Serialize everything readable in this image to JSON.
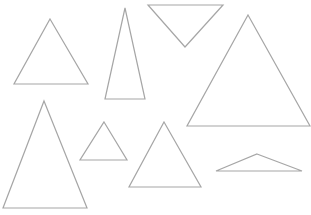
{
  "canvas": {
    "width": 311,
    "height": 215,
    "background": "#ffffff",
    "stroke_color": "#a6a6a6"
  },
  "shapes": [
    {
      "id": "triangle-1",
      "type": "triangle",
      "orientation": "up",
      "points": [
        [
          50,
          19
        ],
        [
          88,
          84
        ],
        [
          14,
          84
        ]
      ]
    },
    {
      "id": "triangle-2",
      "type": "triangle",
      "orientation": "up",
      "points": [
        [
          125,
          8
        ],
        [
          145,
          99
        ],
        [
          105,
          99
        ]
      ]
    },
    {
      "id": "triangle-3",
      "type": "triangle",
      "orientation": "down",
      "points": [
        [
          148,
          5
        ],
        [
          223,
          5
        ],
        [
          185,
          47
        ]
      ]
    },
    {
      "id": "triangle-4",
      "type": "triangle",
      "orientation": "up",
      "points": [
        [
          248,
          15
        ],
        [
          310,
          126
        ],
        [
          187,
          126
        ]
      ]
    },
    {
      "id": "triangle-5",
      "type": "triangle",
      "orientation": "up",
      "points": [
        [
          44,
          101
        ],
        [
          87,
          208
        ],
        [
          3,
          208
        ]
      ]
    },
    {
      "id": "triangle-6",
      "type": "triangle",
      "orientation": "up",
      "points": [
        [
          104,
          122
        ],
        [
          127,
          160
        ],
        [
          80,
          160
        ]
      ]
    },
    {
      "id": "triangle-7",
      "type": "triangle",
      "orientation": "up",
      "points": [
        [
          164,
          122
        ],
        [
          201,
          187
        ],
        [
          129,
          187
        ]
      ]
    },
    {
      "id": "triangle-8",
      "type": "triangle",
      "orientation": "up",
      "points": [
        [
          257,
          154
        ],
        [
          302,
          171
        ],
        [
          216,
          171
        ]
      ]
    }
  ]
}
